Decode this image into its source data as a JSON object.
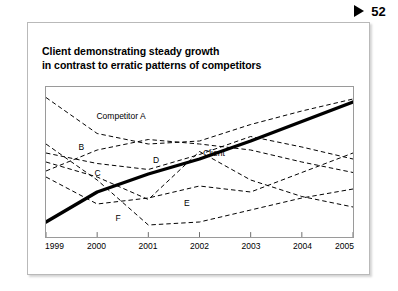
{
  "page_marker": {
    "icon": "play-triangle-icon",
    "number": "52"
  },
  "slide": {
    "title_line_1": "Client demonstrating steady growth",
    "title_line_2": "in contrast to erratic patterns of competitors"
  },
  "chart_data": {
    "type": "line",
    "title": "Client demonstrating steady growth in contrast to erratic patterns of competitors",
    "xlabel": "",
    "ylabel": "",
    "grid": false,
    "legend": "inline-labels",
    "x": [
      "1999",
      "2000",
      "2001",
      "2002",
      "2003",
      "2004",
      "2005"
    ],
    "xlim": [
      "1999",
      "2005"
    ],
    "ylim": [
      0,
      100
    ],
    "axis_labels": [
      {
        "label": "1999",
        "x": 0
      },
      {
        "label": "2000",
        "x": 1
      },
      {
        "label": "2001",
        "x": 2
      },
      {
        "label": "2002",
        "x": 3
      },
      {
        "label": "2003",
        "x": 4
      },
      {
        "label": "2004",
        "x": 5
      },
      {
        "label": "2005",
        "x": 6
      }
    ],
    "series": [
      {
        "name": "Client",
        "style": "solid-thick",
        "color": "#000000",
        "label_text": "Client",
        "label_x": 3.05,
        "label_y": 56,
        "values": [
          10,
          30,
          42,
          52,
          64,
          77,
          90
        ]
      },
      {
        "name": "Competitor A",
        "style": "dashed",
        "color": "#000000",
        "label_text": "Competitor A",
        "label_x": 0.98,
        "label_y": 80,
        "values": [
          93,
          69,
          62,
          64,
          75,
          84,
          92
        ]
      },
      {
        "name": "B",
        "style": "dashed",
        "color": "#000000",
        "label_text": "B",
        "label_x": 0.63,
        "label_y": 60,
        "values": [
          44,
          58,
          65,
          62,
          58,
          50,
          43
        ]
      },
      {
        "name": "C",
        "style": "dashed",
        "color": "#000000",
        "label_text": "C",
        "label_x": 0.94,
        "label_y": 43,
        "values": [
          56,
          49,
          45,
          55,
          67,
          60,
          52
        ]
      },
      {
        "name": "D",
        "style": "dashed",
        "color": "#000000",
        "label_text": "D",
        "label_x": 2.08,
        "label_y": 51,
        "values": [
          50,
          40,
          25,
          57,
          38,
          27,
          20
        ]
      },
      {
        "name": "E",
        "style": "dashed",
        "color": "#000000",
        "label_text": "E",
        "label_x": 2.68,
        "label_y": 23,
        "values": [
          40,
          22,
          26,
          34,
          30,
          43,
          56
        ]
      },
      {
        "name": "F",
        "style": "dashed",
        "color": "#000000",
        "label_text": "F",
        "label_x": 1.35,
        "label_y": 13,
        "values": [
          62,
          38,
          8,
          10,
          18,
          26,
          32
        ]
      }
    ]
  }
}
